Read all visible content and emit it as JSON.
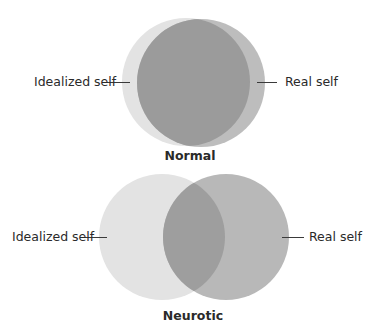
{
  "colors": {
    "idealized_self": "#e3e3e3",
    "real_self": "#b8b8b8",
    "overlap": "#9e9e9e",
    "text": "#2a2a2a"
  },
  "diagrams": [
    {
      "caption": "Normal",
      "left_label": "Idealized self",
      "right_label": "Real self",
      "overlap": "high"
    },
    {
      "caption": "Neurotic",
      "left_label": "Idealized self",
      "right_label": "Real self",
      "overlap": "partial"
    }
  ]
}
